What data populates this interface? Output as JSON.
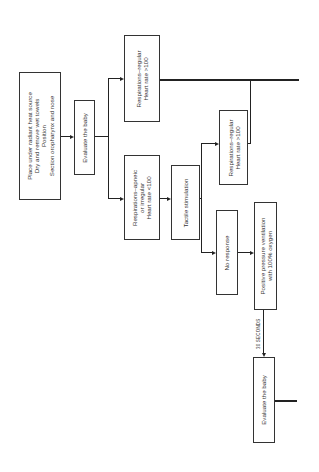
{
  "diagram": {
    "type": "flowchart",
    "orientation": "rotated-90-ccw",
    "nodes": {
      "initial_steps": {
        "lines": [
          "Place under radiant heat source",
          "Dry and remove wet towels",
          "Position",
          "Section oropharynx and nose"
        ]
      },
      "evaluate_1": {
        "lines": [
          "Evaluate the baby"
        ]
      },
      "resp_regular_1": {
        "lines": [
          "Respirations–regular",
          "Heart rate >100"
        ]
      },
      "resp_apneic": {
        "lines": [
          "Respirations–apneic",
          "or irregular",
          "Heart rate <100"
        ]
      },
      "tactile": {
        "lines": [
          "Tactile stimulation"
        ]
      },
      "resp_regular_2": {
        "lines": [
          "Respirations–regular",
          "Heart rate >100"
        ]
      },
      "no_response": {
        "lines": [
          "No response"
        ]
      },
      "ppv": {
        "lines": [
          "Positive pressure ventilation",
          "with 100% oxygen"
        ]
      },
      "evaluate_2": {
        "lines": [
          "Evaluate the baby"
        ]
      }
    },
    "edge_labels": {
      "ppv_to_evaluate": "30 SECONDS"
    },
    "colors": {
      "line": "#222222",
      "box_border": "#333333",
      "background": "#ffffff"
    }
  }
}
